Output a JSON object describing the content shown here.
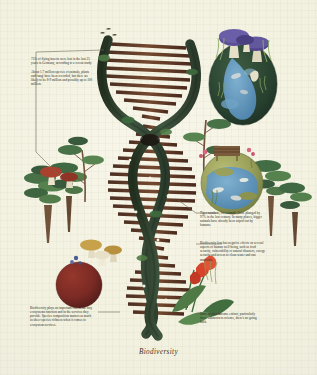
{
  "poster": {
    "title": "Biodiversity",
    "background_color": "#f2f1df",
    "text_color": "#2b2a22",
    "leader_line_color": "#6b6756"
  },
  "palette": {
    "helix_backbone": "#3d5240",
    "helix_backbone_dark": "#2c3b2e",
    "helix_rung": "#6b4430",
    "helix_rung_dark": "#4e3123",
    "foliage_dark": "#2f5135",
    "foliage_mid": "#4f7a46",
    "foliage_light": "#7ea05e",
    "globe_water": "#5a8fb5",
    "globe_land": "#9aa05a",
    "vignette_dark": "#2b4434",
    "mushroom_purple": "#5b4f96",
    "mushroom_ochre": "#c8a24a",
    "mushroom_red": "#a8422f",
    "sphere_maroon": "#7a2a24",
    "flower_red": "#d8432c",
    "trunk_brown": "#6b4a32"
  },
  "annotations": [
    {
      "id": "note-insects",
      "name": "note-flying-insects",
      "lines": [
        "75% of flying insects were lost in the last 25 years in Germany, according to a recent study.",
        "About 1.7 million species of animals, plants and fungi have been recorded, but there are likely to be 8-9 million and possibly up to 100 million."
      ]
    },
    {
      "id": "note-tigers",
      "name": "note-tiger-numbers",
      "lines": [
        "Tiger numbers, for example, have plunged by 97% in the last century. In many places, bigger animals have already been wiped out by humans."
      ]
    },
    {
      "id": "note-wellbeing",
      "name": "note-human-wellbeing",
      "lines": [
        "Biodiversity loss has negative effects on several aspects of human well-being, such as food security, vulnerability to natural disasters, energy security and access to clean water and raw materials."
      ]
    },
    {
      "id": "note-extinct",
      "name": "note-extinction",
      "lines": [
        "Once species become extinct, particularly those unknown to science, there's no going back."
      ]
    },
    {
      "id": "note-services",
      "name": "note-ecosystem-services",
      "lines": [
        "Biodiversity plays an important role in the way ecosystems function and in the services they provide. Species composition matters as much as sheer species richness when it comes to ecosystem services."
      ]
    }
  ],
  "illustration": {
    "central_motif": "dna-double-helix",
    "elements": [
      "dna-double-helix",
      "purple-mushroom-cluster",
      "dark-green-circular-vignette",
      "globe-circle-inset",
      "maroon-sphere",
      "ochre-mushroom-cluster",
      "red-mushroom-cluster",
      "red-flower",
      "conifer-trees",
      "deciduous-trees",
      "small-birds",
      "park-bench"
    ]
  }
}
